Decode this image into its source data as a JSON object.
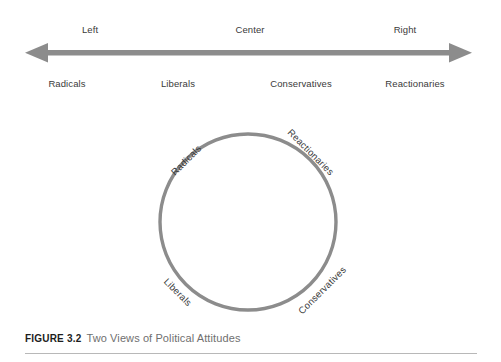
{
  "figure": {
    "number_label": "FIGURE 3.2",
    "title": "Two Views of Political Attitudes"
  },
  "colors": {
    "arrow": "#8c8c8c",
    "circle_stroke": "#8c8c8c",
    "label_text": "#3a3a3a",
    "caption_number": "#1d1d1d",
    "caption_title": "#6f6f6f",
    "rule": "#b8b8b8",
    "background": "#ffffff"
  },
  "linear_diagram": {
    "axis_top_labels": [
      {
        "text": "Left",
        "x": 90
      },
      {
        "text": "Center",
        "x": 250
      },
      {
        "text": "Right",
        "x": 405
      }
    ],
    "axis_bottom_labels": [
      {
        "text": "Radicals",
        "x": 67
      },
      {
        "text": "Liberals",
        "x": 178
      },
      {
        "text": "Conservatives",
        "x": 301
      },
      {
        "text": "Reactionaries",
        "x": 415
      }
    ],
    "arrow": {
      "left_end_x": 25,
      "right_end_x": 472,
      "direction": "double-headed"
    }
  },
  "circle_diagram": {
    "center_x": 248,
    "center_y": 114,
    "radius": 88,
    "labels": [
      {
        "text": "Radicals",
        "x": 186,
        "y": 52,
        "rotation": -45
      },
      {
        "text": "Reactionaries",
        "x": 311,
        "y": 44,
        "rotation": 45
      },
      {
        "text": "Liberals",
        "x": 178,
        "y": 184,
        "rotation": 45
      },
      {
        "text": "Conservatives",
        "x": 322,
        "y": 182,
        "rotation": -45
      }
    ]
  }
}
